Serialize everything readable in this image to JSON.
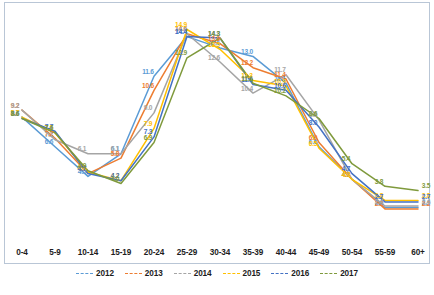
{
  "chart_data": {
    "type": "line",
    "title": "",
    "xlabel": "",
    "ylabel": "",
    "grid": false,
    "legend_position": "bottom",
    "ylim": [
      0,
      16
    ],
    "categories": [
      "0-4",
      "5-9",
      "10-14",
      "15-19",
      "20-24",
      "25-29",
      "30-34",
      "35-39",
      "40-44",
      "45-49",
      "50-54",
      "55-59",
      "60+"
    ],
    "series": [
      {
        "name": "2012",
        "color": "#5b9bd5",
        "values": [
          8.7,
          6.6,
          4.5,
          6.1,
          11.6,
          14.4,
          13.6,
          13.0,
          11.1,
          6.6,
          4.3,
          2.3,
          2.3
        ],
        "labels": [
          "8.7",
          "6.6",
          "4.5",
          "6.1",
          "11.6",
          "14.4",
          "13.6",
          "13.0",
          "11.1",
          "6.6",
          "4.3",
          "2.3",
          "2.3"
        ]
      },
      {
        "name": "2013",
        "color": "#ed7d31",
        "values": [
          9.2,
          7.2,
          4.7,
          5.8,
          10.6,
          14.6,
          13.9,
          12.2,
          11.4,
          6.9,
          4.3,
          2.2,
          2.2
        ],
        "labels": [
          "9.2",
          "7.2",
          "4.7",
          "5.8",
          "10.6",
          "14.6",
          "13.9",
          "12.2",
          "11.4",
          "6.9",
          "4.3",
          "2.2",
          "2.2"
        ]
      },
      {
        "name": "2014",
        "color": "#a5a5a5",
        "values": [
          9.2,
          7.1,
          6.1,
          6.1,
          9.0,
          14.6,
          12.6,
          10.4,
          11.7,
          8.5,
          4.3,
          2.4,
          2.4
        ],
        "labels": [
          "9.2",
          "7.1",
          "6.1",
          "6.1",
          "9.0",
          "14.6",
          "12.6",
          "10.4",
          "11.7",
          "8.5",
          "4.3",
          "2.4",
          "2.4"
        ]
      },
      {
        "name": "2015",
        "color": "#ffc000",
        "values": [
          8.7,
          7.6,
          4.8,
          4.2,
          7.9,
          14.9,
          13.5,
          11.3,
          10.9,
          6.5,
          4.3,
          2.8,
          2.8
        ],
        "labels": [
          "8.7",
          "7.6",
          "4.8",
          "4.2",
          "7.9",
          "14.9",
          "13.5",
          "11.3",
          "10.9",
          "6.5",
          "4.3",
          "2.8",
          "2.8"
        ]
      },
      {
        "name": "2016",
        "color": "#4472c4",
        "values": [
          8.6,
          7.7,
          4.7,
          4.2,
          7.3,
          14.4,
          14.3,
          11.0,
          10.6,
          8.0,
          4.7,
          2.7,
          2.7
        ],
        "labels": [
          "8.6",
          "7.7",
          "4.7",
          "4.2",
          "7.3",
          "14.4",
          "14.3",
          "11.0",
          "10.6",
          "8.0",
          "4.7",
          "2.7",
          "2.7"
        ]
      },
      {
        "name": "2017",
        "color": "#7f9a3c",
        "values": [
          8.6,
          7.6,
          4.9,
          4.0,
          6.9,
          12.9,
          14.3,
          11.1,
          10.2,
          8.6,
          5.4,
          3.8,
          3.5
        ],
        "labels": [
          "8.6",
          "7.6",
          "4.9",
          "4.0",
          "6.9",
          "12.9",
          "14.3",
          "11.1",
          "10.2",
          "8.6",
          "5.4",
          "3.8",
          "3.5"
        ]
      }
    ]
  },
  "legend": {
    "items": [
      {
        "label": "2012",
        "color": "#5b9bd5"
      },
      {
        "label": "2013",
        "color": "#ed7d31"
      },
      {
        "label": "2014",
        "color": "#a5a5a5"
      },
      {
        "label": "2015",
        "color": "#ffc000"
      },
      {
        "label": "2016",
        "color": "#4472c4"
      },
      {
        "label": "2017",
        "color": "#7f9a3c"
      }
    ]
  },
  "caption": ""
}
